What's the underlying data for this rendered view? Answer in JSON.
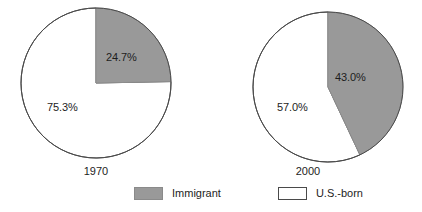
{
  "chart_data": {
    "type": "pie",
    "title": "",
    "charts": [
      {
        "name": "1970",
        "year_label": "1970",
        "center": [
          96,
          83
        ],
        "radius": 75,
        "slices": [
          {
            "label": "Immigrant",
            "value": 24.7,
            "value_label": "24.7%",
            "color": "#999999",
            "label_x": 117,
            "label_y": 51
          },
          {
            "label": "U.S.-born",
            "value": 75.3,
            "value_label": "75.3%",
            "color": "#ffffff",
            "label_x": 62,
            "label_y": 101
          }
        ]
      },
      {
        "name": "2000",
        "year_label": "2000",
        "center": [
          328,
          87
        ],
        "radius": 75,
        "slices": [
          {
            "label": "Immigrant",
            "value": 43.0,
            "value_label": "43.0%",
            "color": "#999999",
            "label_x": 346,
            "label_y": 71
          },
          {
            "label": "U.S.-born",
            "value": 57.0,
            "value_label": "57.0%",
            "color": "#ffffff",
            "label_x": 291,
            "label_y": 101
          }
        ]
      }
    ],
    "legend": {
      "position": "bottom-center",
      "entries": [
        {
          "label": "Immigrant",
          "color": "#999999"
        },
        {
          "label": "U.S.-born",
          "color": "#ffffff"
        }
      ]
    },
    "xlabel": "",
    "ylabel": "",
    "grid": false
  },
  "colors": {
    "immigrant_fill": "#999999",
    "usborn_fill": "#ffffff",
    "outline": "#4a4a4a",
    "text": "#1d1d1d",
    "background": "#ffffff"
  }
}
